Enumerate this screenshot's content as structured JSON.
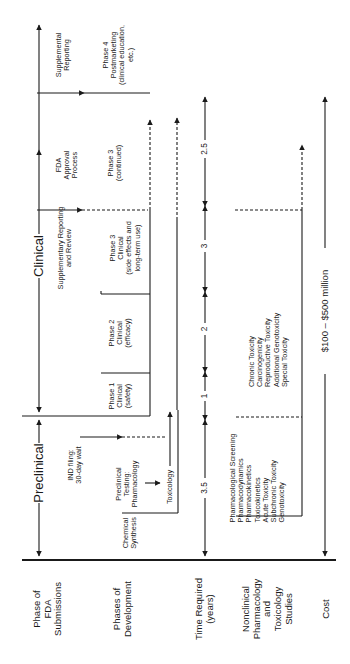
{
  "row_headers": {
    "fda_submissions": "Phase of\nFDA\nSubmissions",
    "development": "Phases of\nDevelopment",
    "time": "Time Required\n(years)",
    "nonclinical": "Nonclinical\nPharmacology\nand\nToxicology\nStudies",
    "cost": "Cost"
  },
  "fda_phases": {
    "preclinical": "Preclinical",
    "clinical": "Clinical",
    "supplementary_review": "Supplementary Reporting\nand Review",
    "fda_approval": "FDA\nApproval\nProcess",
    "supplemental_reporting": "Supplemental\nReporting",
    "ind_filing": "IND filing:\n30-day wait"
  },
  "development": {
    "chemical_synthesis": "Chemical\nSynthesis",
    "preclinical_testing": "Preclinical\nTesting:\nPharmacology",
    "toxicology": "Toxicology",
    "phase1": "Phase 1\nClinical\n(safety)",
    "phase2": "Phase 2\nClinical\n(efficacy)",
    "phase3": "Phase 3\nClinical\n(side effects and\nlong-term use)",
    "phase3_cont": "Phase 3\n(continued)",
    "phase4": "Phase 4\nPostmarketing\n(clinical education,\netc.)"
  },
  "time_years": {
    "preclinical": "3.5",
    "phase1": "1",
    "phase2": "2",
    "phase3": "3",
    "approval": "2.5"
  },
  "nonclinical": {
    "early_studies": "Pharmacological Screening\nPharmacodynamics\nPharmacokinetics\nToxicokinetics\nAcute Toxicity\nSubchronic Toxicity\nGenotoxicity",
    "late_studies": "Chronic Toxicity\nCarcinogenicity\nReproductive Toxicity\nAdditional Genotoxicity\nSpecial Toxicity"
  },
  "cost": {
    "range": "$100 – $500 million"
  },
  "colors": {
    "line": "#1a1a1a",
    "background": "#ffffff"
  }
}
